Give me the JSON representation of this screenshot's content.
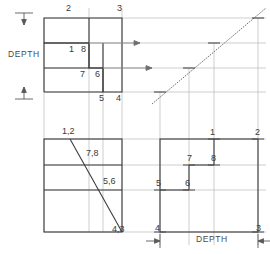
{
  "drawing": {
    "title": "Orthographic projection with 45-degree miter line",
    "stroke_object": "#3c3c3c",
    "stroke_projection": "#b4b4b4",
    "stroke_miter": "#6e6e6e",
    "text_color": "#3a3a3a",
    "background": "#ffffff"
  },
  "views": {
    "top": {
      "name": "top-view",
      "corner_labels": [
        {
          "text": "2",
          "x": 66,
          "y": 8
        },
        {
          "text": "3",
          "x": 117,
          "y": 8
        },
        {
          "text": "1",
          "x": 69,
          "y": 49
        },
        {
          "text": "8",
          "x": 80,
          "y": 49
        },
        {
          "text": "7",
          "x": 80,
          "y": 74
        },
        {
          "text": "6",
          "x": 95,
          "y": 74
        },
        {
          "text": "5",
          "x": 99,
          "y": 97
        },
        {
          "text": "4",
          "x": 117,
          "y": 97
        }
      ]
    },
    "front": {
      "name": "front-view",
      "corner_labels": [
        {
          "text": "1,2",
          "x": 63,
          "y": 130
        },
        {
          "text": "7,8",
          "x": 87,
          "y": 152
        },
        {
          "text": "5,6",
          "x": 104,
          "y": 180
        },
        {
          "text": "4,3",
          "x": 114,
          "y": 228
        }
      ]
    },
    "side": {
      "name": "side-view",
      "corner_labels": [
        {
          "text": "1",
          "x": 211,
          "y": 131
        },
        {
          "text": "2",
          "x": 256,
          "y": 131
        },
        {
          "text": "7",
          "x": 188,
          "y": 157
        },
        {
          "text": "8",
          "x": 212,
          "y": 157
        },
        {
          "text": "5",
          "x": 157,
          "y": 181
        },
        {
          "text": "6",
          "x": 186,
          "y": 181
        },
        {
          "text": "4",
          "x": 156,
          "y": 227
        },
        {
          "text": "3",
          "x": 256,
          "y": 227
        }
      ]
    },
    "miter": {
      "name": "miter-line-45deg"
    }
  },
  "annotations": {
    "depth_left": {
      "text": "DEPTH",
      "x": 8,
      "y": 54
    },
    "depth_bottom": {
      "text": "DEPTH",
      "x": 196,
      "y": 238
    }
  }
}
